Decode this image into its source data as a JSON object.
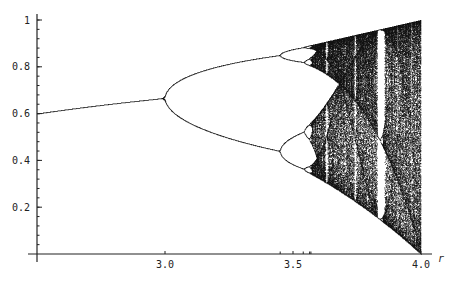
{
  "chart_data": {
    "type": "scatter",
    "title": "",
    "subtitle": "Logistic map bifurcation diagram x_{n+1} = r x_n (1 - x_n)",
    "xlabel": "r",
    "ylabel": "",
    "xlim": [
      2.5,
      4.0
    ],
    "ylim": [
      0,
      1.02
    ],
    "grid": false,
    "legend": null,
    "x_ticks": [
      {
        "value": 3.0,
        "label": "3.0"
      },
      {
        "value": 3.5,
        "label": "3.5"
      },
      {
        "value": 4.0,
        "label": "4.0"
      }
    ],
    "y_ticks": [
      {
        "value": 0.2,
        "label": "0.2"
      },
      {
        "value": 0.4,
        "label": "0.4"
      },
      {
        "value": 0.6,
        "label": "0.6"
      },
      {
        "value": 0.8,
        "label": "0.8"
      },
      {
        "value": 1.0,
        "label": "1"
      }
    ],
    "x_minor_ticks": [
      3.45,
      3.54,
      3.565,
      3.57
    ],
    "y_minor_step": 0.04,
    "series": [
      {
        "name": "attractor",
        "description": "Period-1 fixed point from (2.5,0.6) to (3.0,0.667), period-2 branches 3.0-3.45, period-4 3.45-3.54, chaos from ~3.57 to 4.0 with periodic windows near 3.63, 3.74 and 3.83",
        "sample_points": [
          {
            "r": 2.5,
            "x": [
              0.6
            ]
          },
          {
            "r": 3.0,
            "x": [
              0.667
            ]
          },
          {
            "r": 3.2,
            "x": [
              0.513,
              0.799
            ]
          },
          {
            "r": 3.45,
            "x": [
              0.433,
              0.847
            ]
          },
          {
            "r": 3.5,
            "x": [
              0.383,
              0.501,
              0.827,
              0.875
            ]
          },
          {
            "r": 4.0,
            "x": [
              0.0,
              1.0
            ]
          }
        ]
      }
    ],
    "render": {
      "color": "#111111",
      "r_steps": 1400,
      "transient": 300,
      "iterations": 160
    }
  },
  "axes": {
    "x_label": "r"
  }
}
